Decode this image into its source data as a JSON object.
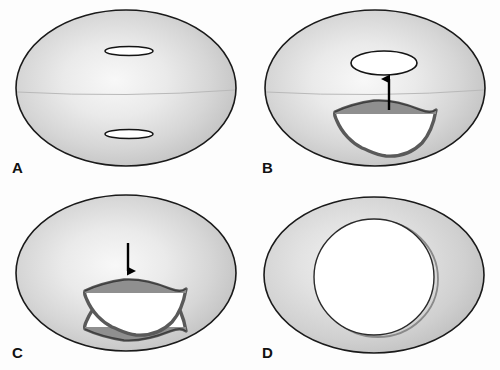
{
  "figure": {
    "background_color": "#fdfdfd",
    "width": 500,
    "height": 370
  },
  "palette": {
    "body_edge": "#1a1a1a",
    "body_fill_center": "#f7f7f7",
    "body_fill_mid": "#dcdcdc",
    "body_fill_rim": "#c2c2c2",
    "cup_rim_stroke": "#4a4a4a",
    "cup_rim_fill": "#9a9a9a",
    "cup_flange_fill": "#8f8f8f",
    "cup_interior": "#ffffff",
    "slit_fill": "#ffffff",
    "slit_stroke": "#141414",
    "arrow_color": "#000000",
    "midline": "#b9b9b9",
    "label_color": "#111111"
  },
  "panels": [
    {
      "id": "panel-a",
      "label": "A",
      "label_name": "panel-label-a",
      "description": "Intact ellipsoid with two closed slit-like apertures, upper and lower, and a faint equatorial line",
      "elements": {
        "body": "ellipse-body",
        "upper_aperture": "upper-slit",
        "lower_aperture": "lower-slit",
        "midline": "equator-line"
      },
      "aperture_state": "closed-slit",
      "arrow": null
    },
    {
      "id": "panel-b",
      "label": "B",
      "label_name": "panel-label-b",
      "description": "Upper aperture dilated into an open oval; a cup-shaped structure below migrates upward",
      "elements": {
        "body": "ellipse-body",
        "upper_aperture": "open-oval",
        "lower_structure": "cup-upright",
        "midline": "equator-line"
      },
      "aperture_state": "upper-open",
      "arrow": {
        "direction": "up",
        "name": "migration-arrow-up"
      }
    },
    {
      "id": "panel-c",
      "label": "C",
      "label_name": "panel-label-c",
      "description": "Two opposed cup-shaped structures, upper inverted and lower upright, with downward movement between them",
      "elements": {
        "body": "ellipse-body",
        "upper_structure": "cup-inverted",
        "lower_structure": "cup-upright"
      },
      "aperture_state": "both-open",
      "arrow": {
        "direction": "down",
        "name": "migration-arrow-down"
      }
    },
    {
      "id": "panel-d",
      "label": "D",
      "label_name": "panel-label-d",
      "description": "Ellipsoid reduced to an annulus with a single large central circular opening",
      "elements": {
        "body": "ellipse-body",
        "central_opening": "central-circular-aperture"
      },
      "aperture_state": "single-large-opening",
      "arrow": null
    }
  ]
}
